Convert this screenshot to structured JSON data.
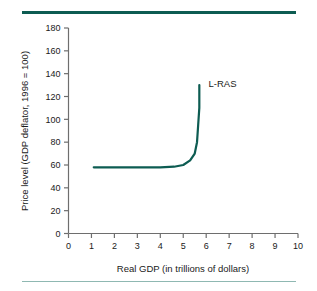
{
  "chart_data": {
    "type": "line",
    "title": "",
    "xlabel": "Real GDP (in trillions of dollars)",
    "ylabel": "Price level (GDP deflator, 1996 = 100)",
    "xlim": [
      0,
      10
    ],
    "ylim": [
      0,
      180
    ],
    "xticks": [
      "0",
      "1",
      "2",
      "3",
      "4",
      "5",
      "6",
      "7",
      "8",
      "9",
      "10"
    ],
    "yticks": [
      "0",
      "20",
      "40",
      "60",
      "80",
      "100",
      "120",
      "140",
      "160",
      "180"
    ],
    "grid": false,
    "legend": "none",
    "series": [
      {
        "name": "L-RAS",
        "label": "L-RAS",
        "color": "#0d5c52",
        "x": [
          1.1,
          2.0,
          3.0,
          4.0,
          4.6,
          5.0,
          5.3,
          5.5,
          5.6,
          5.65,
          5.7,
          5.7,
          5.7
        ],
        "y": [
          58,
          58,
          58,
          58,
          58.5,
          60,
          64,
          70,
          80,
          95,
          110,
          120,
          130
        ]
      }
    ],
    "annotations": [
      {
        "text": "L-RAS",
        "x": 6.1,
        "y": 128
      }
    ]
  },
  "figure": {
    "rule_top_color": "#0d5c52",
    "rule_bottom_color": "#8fb8b2"
  }
}
